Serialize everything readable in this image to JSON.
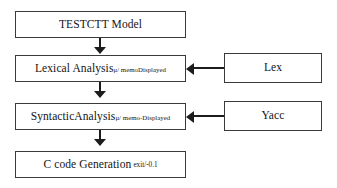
{
  "diagram": {
    "colors": {
      "background": "#ffffff",
      "box_border": "#3a3a3a",
      "arrow": "#1c1c1c",
      "text": "#141414"
    },
    "stages": [
      {
        "id": "model",
        "label": "TESTCTT Model",
        "annotation": "",
        "annotation_style": "none"
      },
      {
        "id": "lexical",
        "label": "Lexical Analysis",
        "annotation": "μ/ memoDisplayed",
        "annotation_style": "subscript"
      },
      {
        "id": "syntax",
        "label": "SyntacticAnalysis",
        "annotation": "μ/ memo-Displayed",
        "annotation_style": "subscript"
      },
      {
        "id": "codegen",
        "label": "C code Generation",
        "annotation": "exit/-0.1",
        "annotation_style": "trailing"
      }
    ],
    "tools": [
      {
        "id": "lex",
        "label": "Lex"
      },
      {
        "id": "yacc",
        "label": "Yacc"
      }
    ],
    "flow_arrows": [
      {
        "id": "model-to-lexical",
        "direction": "down"
      },
      {
        "id": "lexical-to-syntax",
        "direction": "down"
      },
      {
        "id": "syntax-to-codegen",
        "direction": "down"
      },
      {
        "id": "lex-to-lexical",
        "direction": "left"
      },
      {
        "id": "yacc-to-syntax",
        "direction": "left"
      }
    ]
  }
}
